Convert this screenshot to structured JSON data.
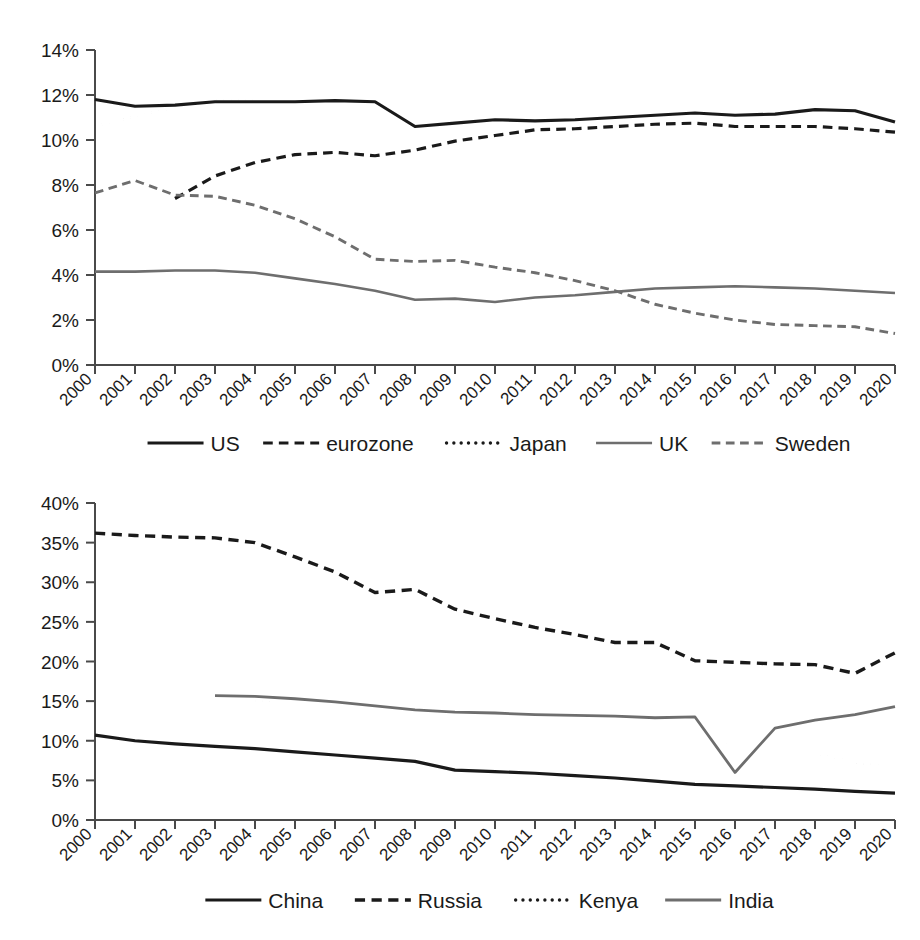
{
  "figure": {
    "background": "#ffffff",
    "ink": "#1a1a1a",
    "gray": "#6e6e6e"
  },
  "chart_data": [
    {
      "id": "advanced-economies",
      "type": "line",
      "title": "",
      "subtitle": "",
      "xlabel": "",
      "ylabel": "",
      "grid": false,
      "legend_position": "bottom",
      "x": [
        2000,
        2001,
        2002,
        2003,
        2004,
        2005,
        2006,
        2007,
        2008,
        2009,
        2010,
        2011,
        2012,
        2013,
        2014,
        2015,
        2016,
        2017,
        2018,
        2019,
        2020
      ],
      "xtick_labels": [
        "2000",
        "2001",
        "2002",
        "2003",
        "2004",
        "2005",
        "2006",
        "2007",
        "2008",
        "2009",
        "2010",
        "2011",
        "2012",
        "2013",
        "2014",
        "2015",
        "2016",
        "2017",
        "2018",
        "2019",
        "2020"
      ],
      "ylim": [
        0,
        14
      ],
      "ytick_values": [
        0,
        2,
        4,
        6,
        8,
        10,
        12,
        14
      ],
      "ytick_labels": [
        "0%",
        "2%",
        "4%",
        "6%",
        "8%",
        "10%",
        "12%",
        "14%"
      ],
      "series": [
        {
          "name": "US",
          "style": "solid",
          "color": "#1a1a1a",
          "width": 3.2,
          "values": [
            11.8,
            11.5,
            11.55,
            11.7,
            11.7,
            11.7,
            11.75,
            11.7,
            10.6,
            10.75,
            10.9,
            10.85,
            10.9,
            11.0,
            11.1,
            11.2,
            11.1,
            11.15,
            11.35,
            11.3,
            10.8
          ]
        },
        {
          "name": "eurozone",
          "style": "dashed",
          "color": "#1a1a1a",
          "width": 3.2,
          "values": [
            null,
            null,
            7.4,
            8.4,
            9.0,
            9.35,
            9.45,
            9.3,
            9.55,
            9.95,
            10.2,
            10.45,
            10.5,
            10.6,
            10.7,
            10.75,
            10.6,
            10.6,
            10.6,
            10.5,
            10.35
          ]
        },
        {
          "name": "Japan",
          "style": "dotted",
          "color": "#1a1a1a",
          "width": 3.4,
          "values": [
            10.6,
            11.05,
            11.45,
            11.75,
            11.75,
            11.8,
            11.8,
            11.7,
            11.35,
            11.1,
            10.95,
            10.85,
            10.8,
            10.85,
            10.95,
            11.05,
            11.0,
            11.05,
            11.1,
            11.15,
            11.2
          ]
        },
        {
          "name": "UK",
          "style": "solid",
          "color": "#6e6e6e",
          "width": 2.6,
          "values": [
            4.15,
            4.15,
            4.2,
            4.2,
            4.1,
            3.85,
            3.6,
            3.3,
            2.9,
            2.95,
            2.8,
            3.0,
            3.1,
            3.25,
            3.4,
            3.45,
            3.5,
            3.45,
            3.4,
            3.3,
            3.2
          ]
        },
        {
          "name": "Sweden",
          "style": "dashed",
          "color": "#6e6e6e",
          "width": 2.9,
          "values": [
            7.65,
            8.2,
            7.55,
            7.5,
            7.1,
            6.5,
            5.7,
            4.7,
            4.6,
            4.65,
            4.35,
            4.1,
            3.75,
            3.3,
            2.7,
            2.3,
            2.0,
            1.8,
            1.75,
            1.7,
            1.4
          ]
        }
      ]
    },
    {
      "id": "emerging-economies",
      "type": "line",
      "title": "",
      "subtitle": "",
      "xlabel": "",
      "ylabel": "",
      "grid": false,
      "legend_position": "bottom",
      "x": [
        2000,
        2001,
        2002,
        2003,
        2004,
        2005,
        2006,
        2007,
        2008,
        2009,
        2010,
        2011,
        2012,
        2013,
        2014,
        2015,
        2016,
        2017,
        2018,
        2019,
        2020
      ],
      "xtick_labels": [
        "2000",
        "2001",
        "2002",
        "2003",
        "2004",
        "2005",
        "2006",
        "2007",
        "2008",
        "2009",
        "2010",
        "2011",
        "2012",
        "2013",
        "2014",
        "2015",
        "2016",
        "2017",
        "2018",
        "2019",
        "2020"
      ],
      "ylim": [
        0,
        40
      ],
      "ytick_values": [
        0,
        5,
        10,
        15,
        20,
        25,
        30,
        35,
        40
      ],
      "ytick_labels": [
        "0%",
        "5%",
        "10%",
        "15%",
        "20%",
        "25%",
        "30%",
        "35%",
        "40%"
      ],
      "series": [
        {
          "name": "China",
          "style": "solid",
          "color": "#1a1a1a",
          "width": 3.2,
          "values": [
            10.7,
            10.0,
            9.6,
            9.3,
            9.0,
            8.6,
            8.2,
            7.8,
            7.4,
            6.3,
            6.1,
            5.9,
            5.6,
            5.3,
            4.9,
            4.5,
            4.3,
            4.1,
            3.9,
            3.6,
            3.4
          ]
        },
        {
          "name": "Russia",
          "style": "dashed",
          "color": "#1a1a1a",
          "width": 3.4,
          "values": [
            36.2,
            35.9,
            35.7,
            35.6,
            35.0,
            33.2,
            31.3,
            28.7,
            29.1,
            26.6,
            25.4,
            24.3,
            23.4,
            22.4,
            22.4,
            20.1,
            19.9,
            19.7,
            19.6,
            18.5,
            21.1
          ]
        },
        {
          "name": "Kenya",
          "style": "dotted",
          "color": "#1a1a1a",
          "width": 3.4,
          "values": [
            13.6,
            13.8,
            14.1,
            14.5,
            15.1,
            14.3,
            13.8,
            13.6,
            13.6,
            13.5,
            13.9,
            13.4,
            12.9,
            12.3,
            11.6,
            11.0,
            9.3,
            8.6,
            8.4,
            7.3,
            6.5
          ]
        },
        {
          "name": "India",
          "style": "solid",
          "color": "#6e6e6e",
          "width": 2.8,
          "values": [
            null,
            null,
            null,
            15.7,
            15.6,
            15.3,
            14.9,
            14.4,
            13.9,
            13.6,
            13.5,
            13.3,
            13.2,
            13.1,
            12.9,
            13.0,
            6.0,
            11.6,
            12.6,
            13.3,
            14.3
          ]
        }
      ]
    }
  ],
  "panels": [
    {
      "name": "advanced-economies-panel",
      "legend": [
        {
          "label": "US",
          "style": "solid",
          "color": "#1a1a1a"
        },
        {
          "label": "eurozone",
          "style": "dashed",
          "color": "#1a1a1a"
        },
        {
          "label": "Japan",
          "style": "dotted",
          "color": "#1a1a1a"
        },
        {
          "label": "UK",
          "style": "solid",
          "color": "#6e6e6e"
        },
        {
          "label": "Sweden",
          "style": "dashed",
          "color": "#6e6e6e"
        }
      ]
    },
    {
      "name": "emerging-economies-panel",
      "legend": [
        {
          "label": "China",
          "style": "solid",
          "color": "#1a1a1a"
        },
        {
          "label": "Russia",
          "style": "dashed",
          "color": "#1a1a1a"
        },
        {
          "label": "Kenya",
          "style": "dotted",
          "color": "#1a1a1a"
        },
        {
          "label": "India",
          "style": "solid",
          "color": "#6e6e6e"
        }
      ]
    }
  ]
}
